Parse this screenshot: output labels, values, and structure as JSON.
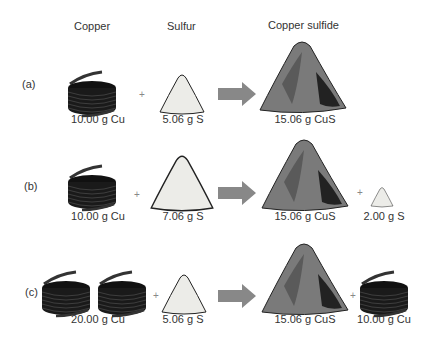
{
  "headers": {
    "copper": "Copper",
    "sulfur": "Sulfur",
    "product": "Copper sulfide"
  },
  "rows": [
    {
      "label": "(a)",
      "reactant1": "10.00 g Cu",
      "reactant2": "5.06 g S",
      "product": "15.06 g CuS",
      "leftover": ""
    },
    {
      "label": "(b)",
      "reactant1": "10.00 g Cu",
      "reactant2": "7.06 g S",
      "product": "15.06 g CuS",
      "leftover": "2.00 g S"
    },
    {
      "label": "(c)",
      "reactant1": "20.00 g Cu",
      "reactant2": "5.06 g S",
      "product": "15.06 g CuS",
      "leftover": "10.00 g Cu"
    }
  ],
  "symbols": {
    "plus": "+"
  },
  "colors": {
    "copper_coil": "#1a1a1a",
    "sulfur": "#e8e8e4",
    "product": "#6e6e6e",
    "arrow": "#888888"
  }
}
